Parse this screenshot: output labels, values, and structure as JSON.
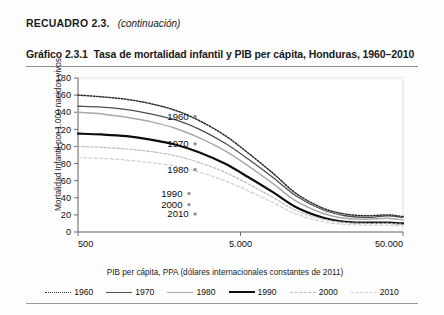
{
  "box": {
    "label": "RECUADRO 2.3.",
    "continuation": "(continuación)"
  },
  "header": {
    "figure_number": "Gráfico 2.3.1",
    "figure_title": "Tasa de mortalidad infantil y PIB per cápita, Honduras, 1960–2010"
  },
  "chart_data": {
    "type": "line",
    "title": "Tasa de mortalidad infantil y PIB per cápita, Honduras, 1960–2010",
    "xlabel": "PIB per cápita, PPA (dólares internacionales constantes de 2011)",
    "ylabel": "Mortalidad Infantil por 1.000 nacidos vivos",
    "xscale": "log",
    "xlim": [
      500,
      50000
    ],
    "ylim": [
      0,
      180
    ],
    "yticks": [
      0,
      20,
      40,
      60,
      80,
      100,
      120,
      140,
      160,
      180
    ],
    "ytick_labels": [
      "0",
      "20",
      "40",
      "60",
      "80",
      "100",
      "120",
      "140",
      "160",
      "180"
    ],
    "xticks": [
      500,
      5000,
      50000
    ],
    "xtick_labels": [
      "500",
      "5.000",
      "50.000"
    ],
    "grid": false,
    "legend_position": "bottom",
    "x": [
      500,
      700,
      1000,
      1400,
      2000,
      2800,
      4000,
      5600,
      8000,
      11000,
      16000,
      22000,
      30000,
      40000,
      50000
    ],
    "series": [
      {
        "name": "1960",
        "color": "#2b2b2b",
        "dash": "1.5,1.6",
        "width": 1.5,
        "values": [
          160,
          158,
          155,
          150,
          142,
          130,
          113,
          92,
          68,
          45,
          28,
          21,
          19,
          20,
          18
        ]
      },
      {
        "name": "1970",
        "color": "#4e4e4e",
        "dash": "none",
        "width": 1.3,
        "values": [
          147,
          146,
          143,
          138,
          131,
          120,
          104,
          85,
          63,
          42,
          26,
          19,
          17,
          19,
          17
        ]
      },
      {
        "name": "1980",
        "color": "#a8a8a8",
        "dash": "none",
        "width": 1.5,
        "values": [
          140,
          138,
          134,
          129,
          121,
          110,
          95,
          77,
          56,
          36,
          22,
          16,
          15,
          16,
          14
        ]
      },
      {
        "name": "1990",
        "color": "#0d0d0d",
        "dash": "none",
        "width": 2.2,
        "values": [
          115,
          114,
          112,
          108,
          102,
          93,
          80,
          64,
          46,
          29,
          17,
          12,
          11,
          11,
          10
        ]
      },
      {
        "name": "2000",
        "color": "#bdbdbd",
        "dash": "2.5,1.8",
        "width": 1.2,
        "values": [
          100,
          99,
          97,
          94,
          89,
          81,
          70,
          56,
          40,
          25,
          15,
          11,
          10,
          10,
          9
        ]
      },
      {
        "name": "2010",
        "color": "#cfcfcf",
        "dash": "3,2.4",
        "width": 1.2,
        "values": [
          87,
          86,
          84,
          81,
          77,
          70,
          60,
          48,
          34,
          21,
          12,
          9,
          8,
          8,
          7
        ]
      }
    ],
    "annotations": [
      {
        "label": "1960",
        "x": 2400,
        "y": 135,
        "marker": true
      },
      {
        "label": "1970",
        "x": 2400,
        "y": 103,
        "marker": true
      },
      {
        "label": "1980",
        "x": 2400,
        "y": 73,
        "marker": true
      },
      {
        "label": "1990",
        "x": 2200,
        "y": 45,
        "marker": true
      },
      {
        "label": "2000",
        "x": 2200,
        "y": 32,
        "marker": true
      },
      {
        "label": "2010",
        "x": 2400,
        "y": 21,
        "marker": true
      }
    ],
    "legend": [
      {
        "label": "1960",
        "color": "#2b2b2b",
        "style": "dotted"
      },
      {
        "label": "1970",
        "color": "#4e4e4e",
        "style": "solid"
      },
      {
        "label": "1980",
        "color": "#a8a8a8",
        "style": "solid"
      },
      {
        "label": "1990",
        "color": "#0d0d0d",
        "style": "solid-thick"
      },
      {
        "label": "2000",
        "color": "#bdbdbd",
        "style": "dashed"
      },
      {
        "label": "2010",
        "color": "#cfcfcf",
        "style": "dashed"
      }
    ]
  }
}
